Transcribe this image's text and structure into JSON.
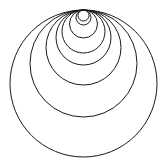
{
  "diagram": {
    "title": "",
    "stroke_color": "#1a1a1a",
    "background": "#ffffff",
    "tangent_point": {
      "x": 83.5,
      "y": 10
    },
    "circles": [
      {
        "id": "circle-1",
        "radius": 5.5
      },
      {
        "id": "circle-2",
        "radius": 7.5
      },
      {
        "id": "circle-3",
        "radius": 14
      },
      {
        "id": "circle-4",
        "radius": 21.5
      },
      {
        "id": "circle-5",
        "radius": 27.5
      },
      {
        "id": "circle-6",
        "radius": 37.5
      },
      {
        "id": "circle-7",
        "radius": 53.5
      },
      {
        "id": "circle-8",
        "radius": 73.5
      }
    ]
  }
}
